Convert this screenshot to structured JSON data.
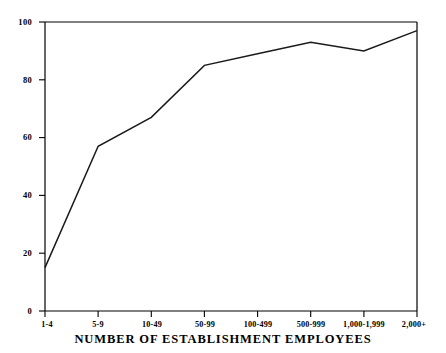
{
  "chart_data": {
    "type": "line",
    "title": "",
    "xlabel": "NUMBER OF ESTABLISHMENT EMPLOYEES",
    "ylabel": "",
    "categories": [
      "1-4",
      "5-9",
      "10-49",
      "50-99",
      "100-499",
      "500-999",
      "1,000-1,999",
      "2,000+"
    ],
    "values": [
      15,
      57,
      67,
      85,
      89,
      93,
      90,
      97
    ],
    "ylim": [
      0,
      100
    ],
    "yticks": [
      0,
      20,
      40,
      60,
      80,
      100
    ],
    "ytick_labels": [
      "0",
      "20",
      "40",
      "60",
      "80",
      "100"
    ],
    "grid": false,
    "legend": "none",
    "series": [
      {
        "name": "",
        "values": [
          15,
          57,
          67,
          85,
          89,
          93,
          90,
          97
        ],
        "color": "#1a1a1a"
      }
    ]
  },
  "axis": {
    "line_color": "#000000",
    "frame": "top-left-right"
  }
}
